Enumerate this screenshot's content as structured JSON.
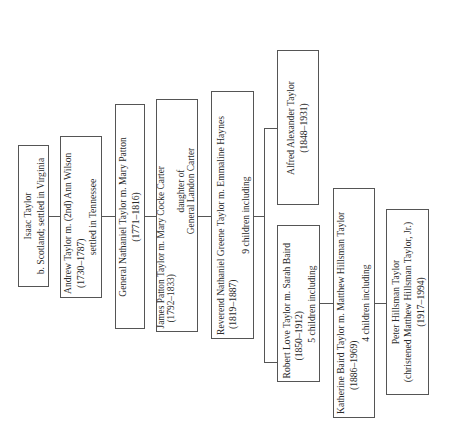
{
  "diagram": {
    "type": "family-tree",
    "orientation": "rotated-90-ccw",
    "nodes": [
      {
        "id": "isaac",
        "lines": [
          "Isaac Taylor",
          "b. Scotland; settled in Virginia"
        ]
      },
      {
        "id": "andrew",
        "lines": [
          "Andrew Taylor m. (2nd) Ann Wilson",
          "(1730–1787)",
          "settled in Tennessee"
        ]
      },
      {
        "id": "nathaniel",
        "lines": [
          "General Nathaniel Taylor m. Mary Patton",
          "(1771–1816)"
        ]
      },
      {
        "id": "james",
        "lines": [
          "James Patton Taylor m. Mary Cocke Carter",
          "(1792–1833)",
          "daughter of",
          "General Landon Carter"
        ]
      },
      {
        "id": "reverend",
        "lines": [
          "Reverend Nathaniel Greene Taylor m. Emmaline Haynes",
          "(1819–1887)",
          "9 children including"
        ]
      },
      {
        "id": "alfred",
        "lines": [
          "Alfred Alexander Taylor",
          "(1848–1931)"
        ]
      },
      {
        "id": "robert",
        "lines": [
          "Robert Love Taylor m. Sarah Baird",
          "(1850–1912)",
          "5 children including"
        ]
      },
      {
        "id": "katherine",
        "lines": [
          "Katherine Baird Taylor m. Matthew Hillsman Taylor",
          "(1886–1969)",
          "4 children including"
        ]
      },
      {
        "id": "peter",
        "lines": [
          "Peter Hillsman Taylor",
          "(christened Matthew Hillsman Taylor, Jr.)",
          "(1917–1994)"
        ]
      }
    ],
    "edges": [
      [
        "isaac",
        "andrew"
      ],
      [
        "andrew",
        "nathaniel"
      ],
      [
        "nathaniel",
        "james"
      ],
      [
        "james",
        "reverend"
      ],
      [
        "reverend",
        "alfred"
      ],
      [
        "reverend",
        "robert"
      ],
      [
        "robert",
        "katherine"
      ],
      [
        "katherine",
        "peter"
      ]
    ]
  }
}
